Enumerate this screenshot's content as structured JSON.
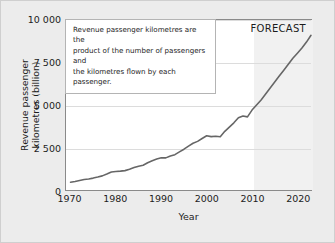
{
  "chart_data": {
    "type": "line",
    "title": "",
    "xlabel": "Year",
    "ylabel": "Revenue passenger\nkilometres (billion)",
    "xlim": [
      1969,
      2023
    ],
    "ylim": [
      0,
      10000
    ],
    "grid": true,
    "legend": null,
    "xticks": [
      1970,
      1980,
      1990,
      2000,
      2010,
      2020
    ],
    "xtick_labels": [
      "1970",
      "1980",
      "1990",
      "2000",
      "2010",
      "2020"
    ],
    "yticks": [
      0,
      2500,
      5000,
      7500,
      10000
    ],
    "ytick_labels": [
      "0",
      "2 500",
      "5 000",
      "7 500",
      "10 000"
    ],
    "series": [
      {
        "name": "Revenue passenger kilometres",
        "line_color": "#666666",
        "x": [
          1970,
          1971,
          1972,
          1973,
          1974,
          1975,
          1976,
          1977,
          1978,
          1979,
          1980,
          1981,
          1982,
          1983,
          1984,
          1985,
          1986,
          1987,
          1988,
          1989,
          1990,
          1991,
          1992,
          1993,
          1994,
          1995,
          1996,
          1997,
          1998,
          1999,
          2000,
          2001,
          2002,
          2003,
          2004,
          2005,
          2006,
          2007,
          2008,
          2009,
          2010,
          2011,
          2012,
          2013,
          2014,
          2015,
          2016,
          2017,
          2018,
          2019,
          2020,
          2021,
          2022,
          2023
        ],
        "y": [
          460,
          500,
          560,
          620,
          650,
          700,
          760,
          830,
          940,
          1060,
          1090,
          1110,
          1140,
          1220,
          1320,
          1400,
          1460,
          1600,
          1720,
          1820,
          1900,
          1890,
          2000,
          2080,
          2240,
          2400,
          2580,
          2750,
          2860,
          3030,
          3190,
          3140,
          3160,
          3130,
          3450,
          3700,
          3950,
          4250,
          4350,
          4300,
          4700,
          5000,
          5300,
          5650,
          6000,
          6350,
          6700,
          7050,
          7400,
          7750,
          8050,
          8350,
          8700,
          9100
        ]
      }
    ],
    "annotations": [
      {
        "name": "definition-note",
        "text": "Revenue passenger kilometres are the\nproduct of the number of passengers and\nthe kilometres flown by each passenger."
      },
      {
        "name": "forecast-label",
        "text": "FORECAST",
        "region_start_year": 2010,
        "region_end_year": 2023,
        "region_color": "#f1f1f1"
      }
    ],
    "colors": {
      "figure_background": "#ececec",
      "plot_background": "#ffffff",
      "axis": "#8a8a8a",
      "grid": "#dcdcdc",
      "text": "#1c1c1c",
      "line": "#666666",
      "forecast_band": "#f1f1f1"
    }
  }
}
